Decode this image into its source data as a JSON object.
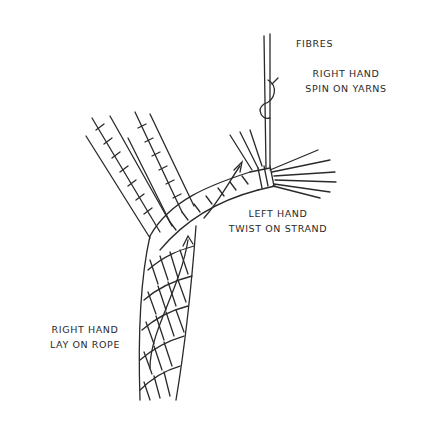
{
  "diagram": {
    "labels": {
      "fibres": "FIBRES",
      "yarn_spin": [
        "RIGHT HAND",
        "SPIN ON YARNS"
      ],
      "strand_twist": [
        "LEFT HAND",
        "TWIST ON STRAND"
      ],
      "rope_lay": [
        "RIGHT HAND",
        "LAY ON ROPE"
      ]
    },
    "colors": {
      "ink": "#2a2a2a",
      "background": "#ffffff"
    }
  }
}
